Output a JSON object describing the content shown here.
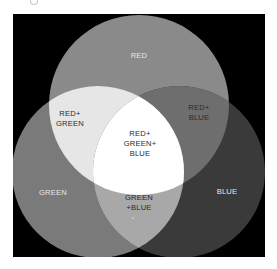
{
  "diagram": {
    "type": "venn",
    "title": "",
    "background_color": "#000000",
    "circles": [
      {
        "id": "red",
        "label": "RED",
        "color": "#8a8a8a"
      },
      {
        "id": "green",
        "label": "GREEN",
        "color": "#7a7a7a"
      },
      {
        "id": "blue",
        "label": "BLUE",
        "color": "#3a3a3a"
      }
    ],
    "regions": {
      "red": {
        "line1": "RED"
      },
      "green": {
        "line1": "GREEN"
      },
      "blue": {
        "line1": "BLUE"
      },
      "red_green": {
        "line1": "RED+",
        "line2": "GREEN",
        "color": "#e6e6e6"
      },
      "red_blue": {
        "line1": "RED+",
        "line2": "BLUE",
        "color": "#6e6e6e"
      },
      "green_blue": {
        "line1": "GREEN",
        "line2": "+BLUE",
        "color": "#a8a8a8"
      },
      "red_green_blue": {
        "line1": "RED+",
        "line2": "GREEN+",
        "line3": "BLUE",
        "color": "#ffffff"
      }
    }
  }
}
